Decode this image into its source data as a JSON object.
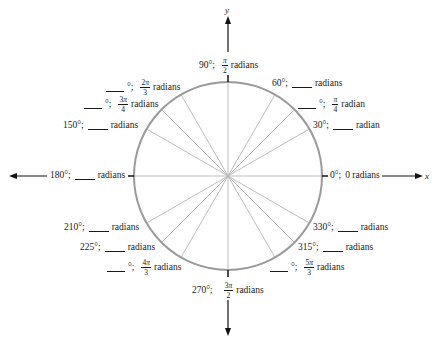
{
  "diagram": {
    "axes": {
      "x_label": "x",
      "y_label": "y"
    },
    "spoke_angles_deg": [
      0,
      30,
      45,
      60,
      90,
      120,
      135,
      150,
      180,
      210,
      225,
      240,
      270,
      300,
      315,
      330
    ],
    "colors": {
      "circle": "#9a9a9a",
      "spokes": "#b5b5b5",
      "axis": "#111111",
      "text": "#1a1a1a"
    },
    "labels": {
      "a0": {
        "deg": "0°;",
        "rad": "0 radians"
      },
      "a30": {
        "deg": "30°;",
        "rad": "radian"
      },
      "a45": {
        "deg": "°;",
        "rad_num": "π",
        "rad_den": "4",
        "rad_word": "radian"
      },
      "a60": {
        "deg": "60°;",
        "rad": "radians"
      },
      "a90": {
        "deg": "90°;",
        "rad_num": "π",
        "rad_den": "2",
        "rad_word": "radians"
      },
      "a120": {
        "deg": "°;",
        "rad_coef": "2",
        "rad_num": "π",
        "rad_den": "3",
        "rad_word": "radians"
      },
      "a135": {
        "deg": "°;",
        "rad_coef": "3",
        "rad_num": "π",
        "rad_den": "4",
        "rad_word": "radians"
      },
      "a150": {
        "deg": "150°;",
        "rad": "radians"
      },
      "a180": {
        "deg": "180°;",
        "rad": "radians"
      },
      "a210": {
        "deg": "210°;",
        "rad": "radians"
      },
      "a225": {
        "deg": "225°;",
        "rad": "radians"
      },
      "a240": {
        "deg": "°;",
        "rad_coef": "4",
        "rad_num": "π",
        "rad_den": "3",
        "rad_word": "radians"
      },
      "a270": {
        "deg": "270°;",
        "rad_coef": "3",
        "rad_num": "π",
        "rad_den": "2",
        "rad_word": "radians"
      },
      "a300": {
        "deg": "°;",
        "rad_coef": "5",
        "rad_num": "π",
        "rad_den": "3",
        "rad_word": "radians"
      },
      "a315": {
        "deg": "315°;",
        "rad": "radians"
      },
      "a330": {
        "deg": "330°;",
        "rad": "radians"
      }
    }
  }
}
